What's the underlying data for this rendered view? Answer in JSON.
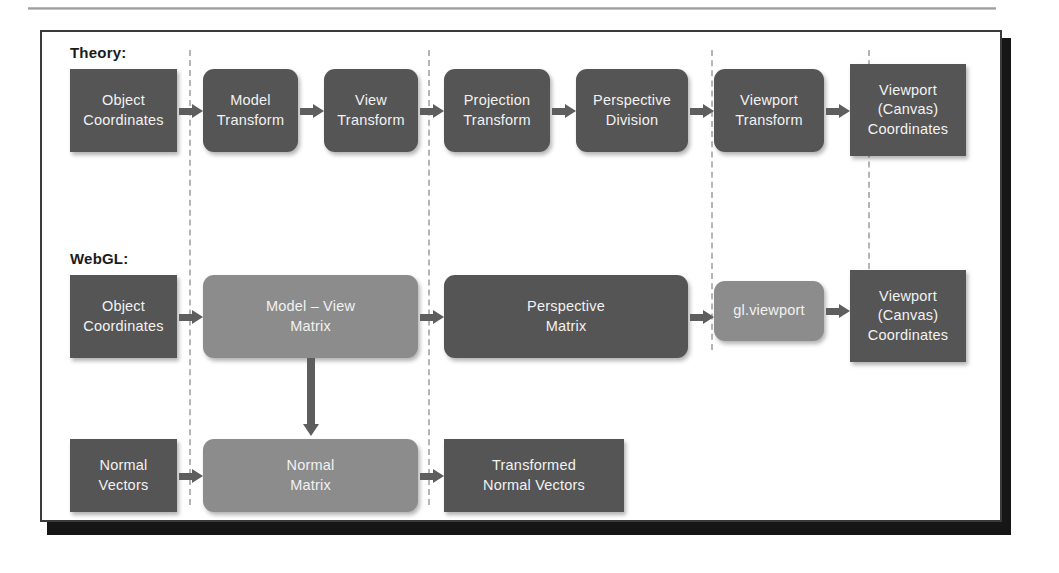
{
  "figure": {
    "title_theory": "Theory:",
    "title_webgl": "WebGL:",
    "colors": {
      "box_dark": "#555555",
      "box_light": "#8c8c8c",
      "arrow": "#5e5e5e",
      "divider": "#b5b5b5",
      "frame": "#3a3a3a",
      "text": "#f2f2f2"
    }
  },
  "theory_row": {
    "label": "Theory:",
    "nodes": [
      {
        "id": "object-coordinates",
        "line1": "Object",
        "line2": "Coordinates",
        "shape": "rect",
        "tone": "dark"
      },
      {
        "id": "model-transform",
        "line1": "Model",
        "line2": "Transform",
        "shape": "round",
        "tone": "dark"
      },
      {
        "id": "view-transform",
        "line1": "View",
        "line2": "Transform",
        "shape": "round",
        "tone": "dark"
      },
      {
        "id": "projection-transform",
        "line1": "Projection",
        "line2": "Transform",
        "shape": "round",
        "tone": "dark"
      },
      {
        "id": "perspective-division",
        "line1": "Perspective",
        "line2": "Division",
        "shape": "round",
        "tone": "dark"
      },
      {
        "id": "viewport-transform",
        "line1": "Viewport",
        "line2": "Transform",
        "shape": "round",
        "tone": "dark"
      },
      {
        "id": "viewport-canvas-coordinates",
        "line1": "Viewport",
        "line2": "(Canvas)",
        "line3": "Coordinates",
        "shape": "rect",
        "tone": "dark"
      }
    ]
  },
  "webgl_row": {
    "label": "WebGL:",
    "nodes": [
      {
        "id": "object-coordinates",
        "line1": "Object",
        "line2": "Coordinates",
        "shape": "rect",
        "tone": "dark"
      },
      {
        "id": "model-view-matrix",
        "line1": "Model – View",
        "line2": "Matrix",
        "shape": "round",
        "tone": "light"
      },
      {
        "id": "perspective-matrix",
        "line1": "Perspective",
        "line2": "Matrix",
        "shape": "round",
        "tone": "dark"
      },
      {
        "id": "gl-viewport",
        "line1": "gl.viewport",
        "line2": "",
        "shape": "round",
        "tone": "light"
      },
      {
        "id": "viewport-canvas-coordinates",
        "line1": "Viewport",
        "line2": "(Canvas)",
        "line3": "Coordinates",
        "shape": "rect",
        "tone": "dark"
      }
    ]
  },
  "normal_row": {
    "nodes": [
      {
        "id": "normal-vectors",
        "line1": "Normal",
        "line2": "Vectors",
        "shape": "rect",
        "tone": "dark"
      },
      {
        "id": "normal-matrix",
        "line1": "Normal",
        "line2": "Matrix",
        "shape": "round",
        "tone": "light"
      },
      {
        "id": "transformed-normal-vectors",
        "line1": "Transformed",
        "line2": "Normal Vectors",
        "shape": "rect",
        "tone": "dark"
      }
    ]
  }
}
